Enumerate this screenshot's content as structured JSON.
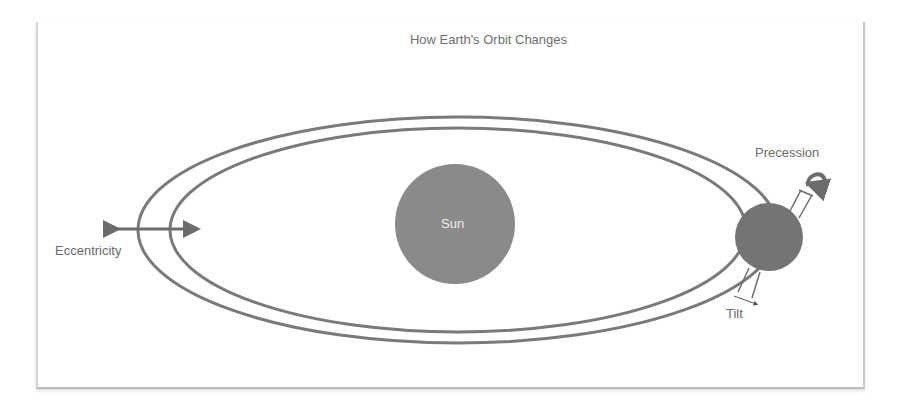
{
  "diagram": {
    "title": "How Earth's Orbit Changes",
    "labels": {
      "sun": "Sun",
      "eccentricity": "Eccentricity",
      "precession": "Precession",
      "tilt": "Tilt"
    },
    "colors": {
      "stroke": "#7a7a7a",
      "sun_fill": "#8a8a8a",
      "earth_fill": "#747474",
      "text": "#6a6a6a",
      "sun_text": "#eeeeee",
      "frame_border": "#c8c8c8"
    },
    "shapes": {
      "outer_orbit": {
        "cx": 458,
        "cy": 230,
        "rx": 320,
        "ry": 113
      },
      "inner_orbit": {
        "cx": 458,
        "cy": 230,
        "rx": 288,
        "ry": 102
      },
      "sun": {
        "cx": 455,
        "cy": 224,
        "r": 60
      },
      "earth": {
        "cx": 769,
        "cy": 237,
        "r": 34
      }
    }
  }
}
